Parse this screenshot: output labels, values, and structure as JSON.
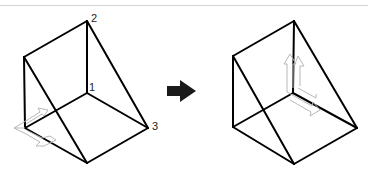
{
  "diagram": {
    "colors": {
      "edge": "#000000",
      "ucs": "#b8b8b8",
      "arrow": "#1a1a1a",
      "rule": "#d4d4d4"
    },
    "before": {
      "labels": [
        {
          "id": "p1",
          "text": "1"
        },
        {
          "id": "p2",
          "text": "2"
        },
        {
          "id": "p3",
          "text": "3"
        }
      ]
    },
    "transition_icon": "right-arrow-icon",
    "after": {
      "labels": []
    }
  }
}
